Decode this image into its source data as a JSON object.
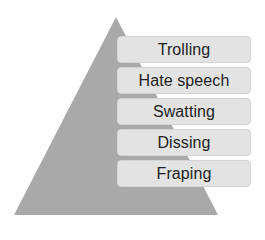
{
  "diagram": {
    "type": "pyramid",
    "pyramid_color": "#a9a9a9",
    "box_color": "#e3e3e3",
    "levels": [
      {
        "label": "Trolling"
      },
      {
        "label": "Hate speech"
      },
      {
        "label": "Swatting"
      },
      {
        "label": "Dissing"
      },
      {
        "label": "Fraping"
      }
    ]
  }
}
